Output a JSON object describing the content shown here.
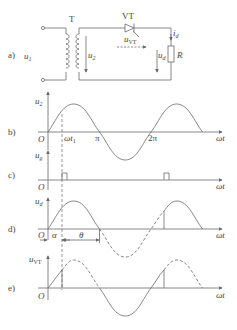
{
  "figure": {
    "colors": {
      "line": "#6a6a6a",
      "text": "#444444",
      "background": "#ffffff"
    },
    "circuit": {
      "panel_label": "a)",
      "transformer_label": "T",
      "thyristor_label": "VT",
      "voltage_labels": {
        "primary": "u",
        "primary_sub": "1",
        "secondary": "u",
        "secondary_sub": "2",
        "thyristor": "u",
        "thyristor_sub": "VT",
        "load": "u",
        "load_sub": "d"
      },
      "current_label": "i",
      "current_sub": "d",
      "resistor_label": "R"
    },
    "panels": [
      {
        "id": "b",
        "label": "b)",
        "ylabel": "u",
        "ylabel_sub": "2",
        "xlabel": "ωt",
        "origin": "O",
        "ticks": [
          {
            "label": "ωt",
            "sub": "1"
          },
          {
            "label": "π"
          },
          {
            "label": "2π"
          }
        ]
      },
      {
        "id": "c",
        "label": "c)",
        "ylabel": "u",
        "ylabel_sub": "g",
        "xlabel": "ωt",
        "origin": "O"
      },
      {
        "id": "d",
        "label": "d)",
        "ylabel": "u",
        "ylabel_sub": "d",
        "xlabel": "ωt",
        "origin": "O",
        "annotations": {
          "alpha": "α",
          "theta": "θ"
        }
      },
      {
        "id": "e",
        "label": "e)",
        "ylabel": "u",
        "ylabel_sub": "VT",
        "xlabel": "ωt",
        "origin": "O"
      }
    ]
  }
}
